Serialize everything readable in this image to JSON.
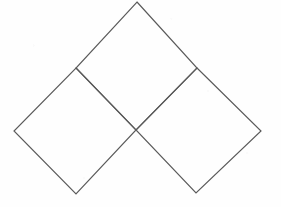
{
  "figure": {
    "name": "three-overlapping-rotated-squares",
    "canvas": {
      "width": 281,
      "height": 207
    },
    "style": {
      "background_color": "#fefefe",
      "stroke_color": "#5a5a5a",
      "stroke_width": 1.15,
      "fill": "none"
    },
    "named_points": {
      "top_apex": {
        "x": 137,
        "y": 2
      },
      "left_vertex": {
        "x": 14,
        "y": 131
      },
      "right_vertex": {
        "x": 261,
        "y": 131
      },
      "bottom_left_vertex": {
        "x": 76,
        "y": 194
      },
      "bottom_right_vertex": {
        "x": 196,
        "y": 193
      },
      "center_crossing": {
        "x": 136,
        "y": 130
      },
      "left_junction": {
        "x": 76,
        "y": 68
      },
      "right_junction": {
        "x": 197,
        "y": 68
      }
    },
    "shapes": [
      {
        "id": "square-top",
        "label": "Top square",
        "points": "137,2 197,68 136,130 76,68"
      },
      {
        "id": "square-bottom-left",
        "label": "Bottom left square",
        "points": "76,68 136,130 76,194 14,131"
      },
      {
        "id": "square-bottom-right",
        "label": "Bottom right square",
        "points": "197,68 261,131 196,193 136,130"
      }
    ]
  }
}
